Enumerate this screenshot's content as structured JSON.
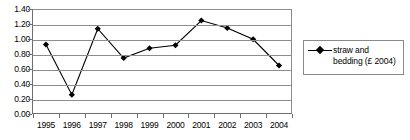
{
  "chart_data": {
    "type": "line",
    "title": "",
    "xlabel": "",
    "ylabel": "",
    "categories": [
      "1995",
      "1996",
      "1997",
      "1998",
      "1999",
      "2000",
      "2001",
      "2002",
      "2003",
      "2004"
    ],
    "series": [
      {
        "name": "straw and bedding (£ 2004)",
        "values": [
          0.94,
          0.27,
          1.15,
          0.76,
          0.89,
          0.93,
          1.26,
          1.16,
          1.01,
          0.66
        ],
        "marker": "diamond",
        "color": "#000000"
      }
    ],
    "ylim": [
      0.0,
      1.4
    ],
    "ytick_step": 0.2,
    "ytick_labels": [
      "0.00",
      "0.20",
      "0.40",
      "0.60",
      "0.80",
      "1.00",
      "1.20",
      "1.40"
    ],
    "grid": "horizontal",
    "legend_position": "right",
    "legend_entries": [
      {
        "line1": "straw and",
        "line2": "bedding (£ 2004)"
      }
    ]
  },
  "colors": {
    "series": "#000000",
    "gridline": "#8c8c8c",
    "axis": "#6e6e6e",
    "legend_border": "#8a8a8a",
    "background": "#ffffff"
  }
}
